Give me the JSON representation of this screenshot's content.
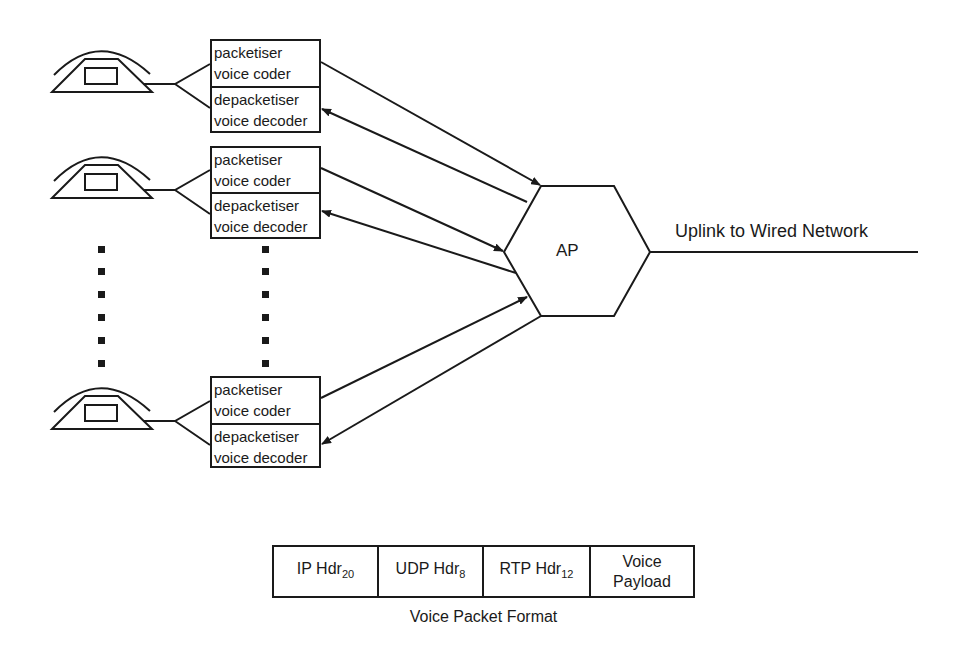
{
  "diagram": {
    "terminals": [
      {
        "id": "terminal-1",
        "coder_lines": [
          "packetiser",
          "voice coder"
        ],
        "decoder_lines": [
          "depacketiser",
          "voice decoder"
        ]
      },
      {
        "id": "terminal-2",
        "coder_lines": [
          "packetiser",
          "voice coder"
        ],
        "decoder_lines": [
          "depacketiser",
          "voice decoder"
        ]
      },
      {
        "id": "terminal-n",
        "coder_lines": [
          "packetiser",
          "voice coder"
        ],
        "decoder_lines": [
          "depacketiser",
          "voice decoder"
        ]
      }
    ],
    "ellipsis_dots": 6,
    "access_point": {
      "label": "AP"
    },
    "uplink": {
      "label": "Uplink to Wired Network"
    },
    "packet_format": {
      "caption": "Voice Packet Format",
      "fields": [
        {
          "name": "IP Hdr",
          "size": "20"
        },
        {
          "name": "UDP Hdr",
          "size": "8"
        },
        {
          "name": "RTP Hdr",
          "size": "12"
        },
        {
          "name": "Voice Payload",
          "line1": "Voice",
          "line2": "Payload",
          "size": ""
        }
      ]
    },
    "colors": {
      "stroke": "#1a1a1a",
      "background": "#ffffff"
    }
  }
}
